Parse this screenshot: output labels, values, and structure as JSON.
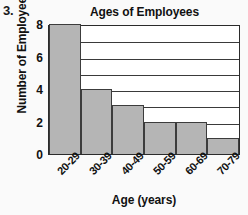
{
  "problem_number": "3.",
  "chart_data": {
    "type": "bar",
    "title": "Ages of Employees",
    "xlabel": "Age (years)",
    "ylabel": "Number of Employees",
    "categories": [
      "20-29",
      "30-39",
      "40-49",
      "50-59",
      "60-69",
      "70-79"
    ],
    "values": [
      8,
      4,
      3,
      2,
      2,
      1
    ],
    "ylim": [
      0,
      8
    ],
    "yticks": [
      0,
      2,
      4,
      6,
      8
    ],
    "ytick_labels": [
      "0",
      "2",
      "4",
      "6",
      "8"
    ],
    "gridlines": [
      1,
      2,
      3,
      4,
      5,
      6,
      7
    ],
    "grid": true,
    "legend": "none",
    "bar_color": "#b5b5b5",
    "bar_border_color": "#3c3c3c",
    "axis_color": "#2b2b2b",
    "plot_background": "#ffffff",
    "page_background": "#fafafa",
    "xtick_rotation": -45
  }
}
